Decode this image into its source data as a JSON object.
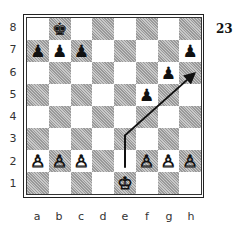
{
  "diagram": {
    "number": "23",
    "files": [
      "a",
      "b",
      "c",
      "d",
      "e",
      "f",
      "g",
      "h"
    ],
    "ranks": [
      "8",
      "7",
      "6",
      "5",
      "4",
      "3",
      "2",
      "1"
    ],
    "colors": {
      "dark_square": "#b5b5b5",
      "light_square": "#ffffff",
      "arrow": "#111111"
    },
    "pieces": [
      {
        "square": "b8",
        "color": "black",
        "type": "king",
        "glyph": "♚"
      },
      {
        "square": "a7",
        "color": "black",
        "type": "pawn",
        "glyph": "♟"
      },
      {
        "square": "b7",
        "color": "black",
        "type": "pawn",
        "glyph": "♟"
      },
      {
        "square": "c7",
        "color": "black",
        "type": "pawn",
        "glyph": "♟"
      },
      {
        "square": "h7",
        "color": "black",
        "type": "pawn",
        "glyph": "♟"
      },
      {
        "square": "g6",
        "color": "black",
        "type": "pawn",
        "glyph": "♟"
      },
      {
        "square": "f5",
        "color": "black",
        "type": "pawn",
        "glyph": "♟"
      },
      {
        "square": "a2",
        "color": "white",
        "type": "pawn",
        "glyph": "♙"
      },
      {
        "square": "b2",
        "color": "white",
        "type": "pawn",
        "glyph": "♙"
      },
      {
        "square": "c2",
        "color": "white",
        "type": "pawn",
        "glyph": "♙"
      },
      {
        "square": "f2",
        "color": "white",
        "type": "pawn",
        "glyph": "♙"
      },
      {
        "square": "g2",
        "color": "white",
        "type": "pawn",
        "glyph": "♙"
      },
      {
        "square": "h2",
        "color": "white",
        "type": "pawn",
        "glyph": "♙"
      },
      {
        "square": "e1",
        "color": "white",
        "type": "king",
        "glyph": "♔"
      }
    ],
    "arrow": {
      "from": "e2",
      "via": "e3",
      "to": "h6"
    }
  }
}
